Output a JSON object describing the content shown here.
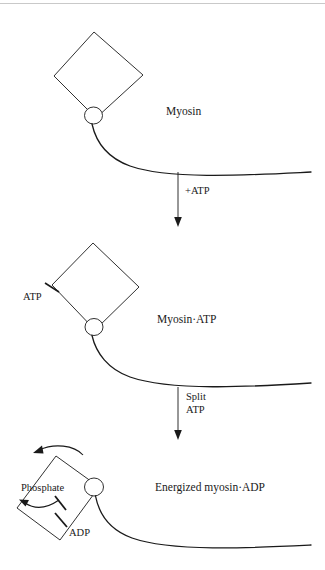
{
  "figure": {
    "title_visible": false,
    "background_color": "#ffffff",
    "stroke_color": "#1a1a1a",
    "text_color": "#1a1a1a",
    "rule_color": "#c9c9c9",
    "width": 325,
    "height": 570
  },
  "stages": [
    {
      "id": "stage-myosin",
      "label": "Myosin",
      "label_x": 166,
      "label_y": 105,
      "head_label": null
    },
    {
      "id": "stage-myosin-atp",
      "label": "Myosin·ATP",
      "label_x": 157,
      "label_y": 313,
      "head_label": "ATP"
    },
    {
      "id": "stage-energized-myosin-adp",
      "label": "Energized myosin·ADP",
      "label_x": 155,
      "label_y": 481,
      "head_label": "ADP",
      "inner_label": "Phosphate"
    }
  ],
  "transitions": [
    {
      "id": "transition-add-atp",
      "label": "+ATP",
      "label_lines": [
        "+ATP"
      ],
      "label_x": 185,
      "label_y": 191,
      "arrow_x": 178,
      "arrow_y_start": 172,
      "arrow_y_end": 226
    },
    {
      "id": "transition-split-atp",
      "label": "Split ATP",
      "label_lines": [
        "Split",
        "ATP"
      ],
      "label_x": 186,
      "label_y": 392,
      "arrow_x": 178,
      "arrow_y_start": 387,
      "arrow_y_end": 440
    }
  ],
  "annotations": {
    "atp_tick_label": "ATP",
    "atp_tick_label_x": 23,
    "atp_tick_label_y": 292,
    "adp_tick_label": "ADP",
    "adp_tick_label_x": 69,
    "adp_tick_label_y": 528,
    "phosphate_label": "Phosphate",
    "phosphate_label_x": 21,
    "phosphate_label_y": 482
  }
}
